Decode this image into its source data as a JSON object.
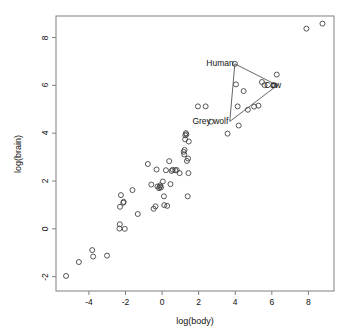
{
  "chart_data": {
    "type": "scatter",
    "title": "",
    "xlabel": "log(body)",
    "ylabel": "log(brain)",
    "xlim": [
      -5.8,
      9.4
    ],
    "ylim": [
      -2.6,
      8.9
    ],
    "xticks": [
      -4,
      -2,
      0,
      2,
      4,
      6,
      8
    ],
    "yticks": [
      -2,
      0,
      2,
      4,
      6,
      8
    ],
    "grid": false,
    "legend": "none",
    "marker": "open-circle",
    "point_color": "#444444",
    "axis_color": "#808080",
    "annotation_line_color": "#555555",
    "points": [
      {
        "x": -5.25,
        "y": -1.97
      },
      {
        "x": -4.55,
        "y": -1.39
      },
      {
        "x": -3.82,
        "y": -0.89
      },
      {
        "x": -3.77,
        "y": -1.16
      },
      {
        "x": -3.01,
        "y": -1.12
      },
      {
        "x": -2.33,
        "y": 0.01
      },
      {
        "x": -2.31,
        "y": 0.19
      },
      {
        "x": -2.3,
        "y": 0.92
      },
      {
        "x": -2.25,
        "y": 1.41
      },
      {
        "x": -2.12,
        "y": 1.09
      },
      {
        "x": -2.1,
        "y": 1.13
      },
      {
        "x": -2.04,
        "y": 0.0
      },
      {
        "x": -1.62,
        "y": 1.62
      },
      {
        "x": -1.33,
        "y": 0.62
      },
      {
        "x": -0.78,
        "y": 2.71
      },
      {
        "x": -0.59,
        "y": 1.85
      },
      {
        "x": -0.46,
        "y": 0.84
      },
      {
        "x": -0.36,
        "y": 0.94
      },
      {
        "x": -0.3,
        "y": 2.48
      },
      {
        "x": -0.25,
        "y": 1.77
      },
      {
        "x": -0.17,
        "y": 1.7
      },
      {
        "x": -0.12,
        "y": 1.76
      },
      {
        "x": -0.1,
        "y": 1.82
      },
      {
        "x": -0.06,
        "y": 1.73
      },
      {
        "x": 0.04,
        "y": 1.98
      },
      {
        "x": 0.1,
        "y": 1.36
      },
      {
        "x": 0.12,
        "y": 0.99
      },
      {
        "x": 0.21,
        "y": 2.45
      },
      {
        "x": 0.28,
        "y": 0.96
      },
      {
        "x": 0.39,
        "y": 2.83
      },
      {
        "x": 0.46,
        "y": 1.87
      },
      {
        "x": 0.52,
        "y": 2.42
      },
      {
        "x": 0.58,
        "y": 2.47
      },
      {
        "x": 0.72,
        "y": 2.45
      },
      {
        "x": 0.8,
        "y": 2.46
      },
      {
        "x": 0.96,
        "y": 2.33
      },
      {
        "x": 1.18,
        "y": 3.22
      },
      {
        "x": 1.21,
        "y": 3.11
      },
      {
        "x": 1.23,
        "y": 3.3
      },
      {
        "x": 1.26,
        "y": 3.74
      },
      {
        "x": 1.27,
        "y": 3.91
      },
      {
        "x": 1.3,
        "y": 4.0
      },
      {
        "x": 1.33,
        "y": 3.95
      },
      {
        "x": 1.36,
        "y": 2.84
      },
      {
        "x": 1.4,
        "y": 1.36
      },
      {
        "x": 1.42,
        "y": 2.94
      },
      {
        "x": 1.44,
        "y": 2.33
      },
      {
        "x": 1.46,
        "y": 3.65
      },
      {
        "x": 1.96,
        "y": 5.12
      },
      {
        "x": 2.38,
        "y": 5.12
      },
      {
        "x": 2.68,
        "y": 4.48
      },
      {
        "x": 3.58,
        "y": 3.98
      },
      {
        "x": 3.98,
        "y": 6.9
      },
      {
        "x": 4.04,
        "y": 6.04
      },
      {
        "x": 4.13,
        "y": 5.12
      },
      {
        "x": 4.19,
        "y": 4.32
      },
      {
        "x": 4.46,
        "y": 5.76
      },
      {
        "x": 4.69,
        "y": 4.98
      },
      {
        "x": 5.03,
        "y": 5.11
      },
      {
        "x": 5.27,
        "y": 5.15
      },
      {
        "x": 5.46,
        "y": 6.14
      },
      {
        "x": 5.6,
        "y": 6.01
      },
      {
        "x": 6.08,
        "y": 6.0
      },
      {
        "x": 6.14,
        "y": 6.01
      },
      {
        "x": 6.27,
        "y": 6.45
      },
      {
        "x": 7.89,
        "y": 8.37
      },
      {
        "x": 8.77,
        "y": 8.58
      }
    ],
    "annotations": {
      "polyline": [
        {
          "x": 3.98,
          "y": 6.9
        },
        {
          "x": 6.3,
          "y": 6.0
        },
        {
          "x": 3.7,
          "y": 4.49
        },
        {
          "x": 3.98,
          "y": 6.9
        }
      ],
      "labels": [
        {
          "text": "Human",
          "x": 3.92,
          "y": 6.92,
          "anchor": "end"
        },
        {
          "text": "Cow",
          "x": 6.05,
          "y": 6.01,
          "anchor": "middle"
        },
        {
          "text": "Grey wolf",
          "x": 3.62,
          "y": 4.5,
          "anchor": "end"
        }
      ]
    }
  },
  "axes": {
    "x_title": "log(body)",
    "y_title": "log(brain)",
    "x_tick_labels": [
      "-4",
      "-2",
      "0",
      "2",
      "4",
      "6",
      "8"
    ],
    "y_tick_labels": [
      "-2",
      "0",
      "2",
      "4",
      "6",
      "8"
    ]
  },
  "annotation_labels": {
    "human": "Human",
    "cow": "Cow",
    "grey_wolf": "Grey wolf"
  }
}
